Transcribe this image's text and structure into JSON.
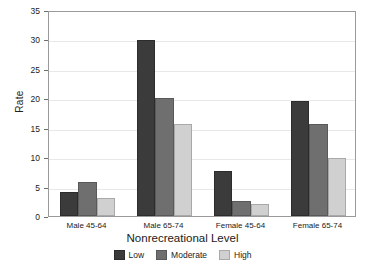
{
  "chart_data": {
    "type": "bar",
    "title": "",
    "subtitle": "",
    "xlabel": "Nonrecreational Level",
    "ylabel": "Rate",
    "categories": [
      "Male 45-64",
      "Male 65-74",
      "Female 45-64",
      "Female 65-74"
    ],
    "series": [
      {
        "name": "Low",
        "color": "#3b3b3b",
        "values": [
          4.1,
          29.9,
          7.7,
          19.5
        ]
      },
      {
        "name": "Moderate",
        "color": "#6f6f6f",
        "values": [
          5.7,
          20.1,
          2.5,
          15.6
        ]
      },
      {
        "name": "High",
        "color": "#d0d0d0",
        "values": [
          3.1,
          15.6,
          2.1,
          9.9
        ]
      }
    ],
    "ylim": [
      0,
      35
    ],
    "yticks": [
      0,
      5,
      10,
      15,
      20,
      25,
      30,
      35
    ],
    "ytick_labels": [
      "0",
      "5",
      "10",
      "15",
      "20",
      "25",
      "30",
      "35"
    ],
    "grid": true,
    "grid_axis": "y",
    "legend_position": "bottom",
    "legend_entries": [
      "Low",
      "Moderate",
      "High"
    ]
  },
  "axes": {
    "y_label": "Rate",
    "x_label": "Nonrecreational Level"
  }
}
